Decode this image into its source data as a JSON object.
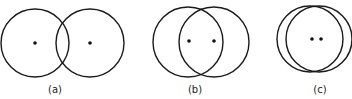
{
  "figure": {
    "panels": [
      {
        "label": "(a)",
        "circles": [
          {
            "cx": 35,
            "cy": 43,
            "r": 34
          },
          {
            "cx": 90,
            "cy": 43,
            "r": 34
          }
        ],
        "dots": [
          {
            "cx": 35,
            "cy": 43
          },
          {
            "cx": 90,
            "cy": 43
          }
        ],
        "label_pos": {
          "x": 55,
          "y": 93
        }
      },
      {
        "label": "(b)",
        "circles": [
          {
            "cx": 188,
            "cy": 42,
            "r": 35
          },
          {
            "cx": 214,
            "cy": 42,
            "r": 35
          }
        ],
        "dots": [
          {
            "cx": 189,
            "cy": 41
          },
          {
            "cx": 214,
            "cy": 41
          }
        ],
        "label_pos": {
          "x": 195,
          "y": 93
        }
      },
      {
        "label": "(c)",
        "circles": [
          {
            "cx": 310,
            "cy": 39,
            "r": 33
          },
          {
            "cx": 319,
            "cy": 39,
            "r": 33
          }
        ],
        "dots": [
          {
            "cx": 312,
            "cy": 39
          },
          {
            "cx": 321,
            "cy": 39
          }
        ],
        "label_pos": {
          "x": 320,
          "y": 93
        }
      }
    ],
    "colors": {
      "stroke": "#1a1a1a",
      "dot": "#111111",
      "background": "#ffffff"
    }
  }
}
